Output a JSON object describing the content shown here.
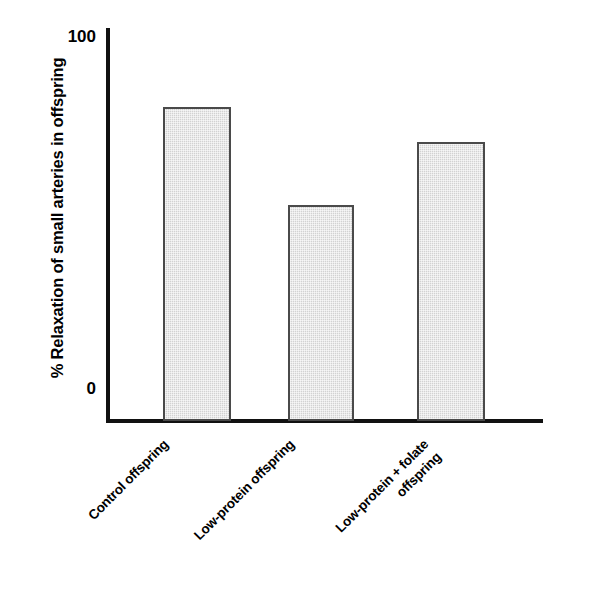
{
  "chart_data": {
    "type": "bar",
    "title": "",
    "subtitle": "",
    "xlabel": "",
    "ylabel": "% Relaxation of small arteries in offspring",
    "categories": [
      "Control offspring",
      "Low-protein offspring",
      "Low-protein + folate offspring"
    ],
    "values": [
      80,
      55,
      71
    ],
    "ylim": [
      0,
      100
    ],
    "ytick_labels": [
      "100",
      "0"
    ],
    "ytick_values": [
      100,
      0
    ],
    "grid": false,
    "legend": null,
    "bar_fill_color": "#d2d2d2",
    "bar_edge_color": "#4a4a4a",
    "axis_color": "#111111"
  },
  "axis": {
    "y_title": "% Relaxation of small arteries in offspring",
    "tick_top": "100",
    "tick_bottom": "0"
  },
  "categories": {
    "c0_line1": "Control offspring",
    "c1_line1": "Low-protein offspring",
    "c2_line1": "Low-protein + folate",
    "c2_line2": "offspring"
  }
}
